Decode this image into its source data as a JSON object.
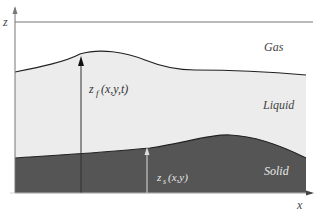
{
  "diagram": {
    "axes": {
      "z_label": "z",
      "x_label": "x"
    },
    "regions": [
      {
        "name": "Gas",
        "fill": "#ffffff"
      },
      {
        "name": "Liquid",
        "fill": "#ececec"
      },
      {
        "name": "Solid",
        "fill": "#555555"
      }
    ],
    "labels": {
      "free_surface_main": "z",
      "free_surface_sub": "f",
      "free_surface_args": "(x,y,t)",
      "solid_surface_main": "z",
      "solid_surface_sub": "s",
      "solid_surface_args": "(x,y)"
    },
    "colors": {
      "axis": "#666666",
      "interface": "#222222",
      "solid_text": "#e8e8e8"
    }
  }
}
